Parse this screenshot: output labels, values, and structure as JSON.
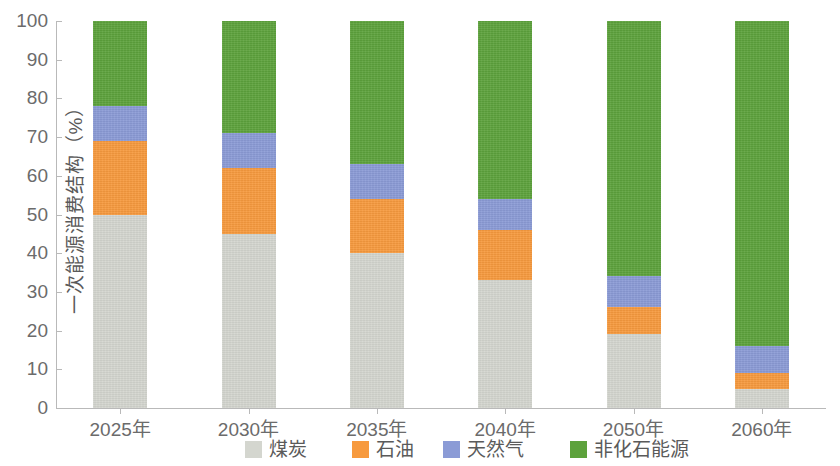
{
  "chart_data": {
    "type": "bar",
    "stacked": true,
    "stack_total": 100,
    "title": "",
    "xlabel": "",
    "ylabel": "一次能源消费结构（%）",
    "ylim": [
      0,
      100
    ],
    "ytick_step": 10,
    "grid": false,
    "legend_position": "bottom",
    "categories": [
      "2025年",
      "2030年",
      "2035年",
      "2040年",
      "2050年",
      "2060年"
    ],
    "ytick_labels": [
      "100",
      "90",
      "80",
      "70",
      "60",
      "50",
      "40",
      "30",
      "20",
      "10",
      "0"
    ],
    "series": [
      {
        "name": "煤炭",
        "color": "#d4d6cf",
        "values": [
          50,
          45,
          40,
          33,
          19,
          5
        ]
      },
      {
        "name": "石油",
        "color": "#f79a3e",
        "values": [
          19,
          17,
          14,
          13,
          7,
          4
        ]
      },
      {
        "name": "天然气",
        "color": "#8b9bd6",
        "values": [
          9,
          9,
          9,
          8,
          8,
          7
        ]
      },
      {
        "name": "非化石能源",
        "color": "#5da23c",
        "values": [
          22,
          29,
          37,
          46,
          66,
          84
        ]
      }
    ],
    "cumulative_tops": {
      "煤炭": [
        50,
        45,
        40,
        33,
        19,
        5
      ],
      "石油": [
        69,
        62,
        54,
        46,
        26,
        9
      ],
      "天然气": [
        78,
        71,
        63,
        54,
        34,
        16
      ],
      "非化石能源": [
        100,
        100,
        100,
        100,
        100,
        100
      ]
    }
  },
  "legend": {
    "items": [
      {
        "label": "煤炭",
        "color": "#d4d6cf",
        "left": 245
      },
      {
        "label": "石油",
        "color": "#f79a3e",
        "left": 352
      },
      {
        "label": "天然气",
        "color": "#8b9bd6",
        "left": 443
      },
      {
        "label": "非化石能源",
        "color": "#5da23c",
        "left": 570
      }
    ]
  },
  "axes": {
    "y_title": "一次能源消费结构（%）"
  }
}
